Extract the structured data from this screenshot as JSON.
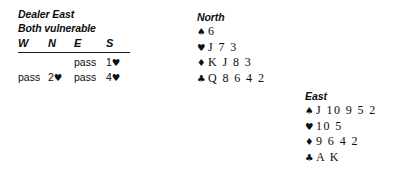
{
  "deal": {
    "dealer_line": "Dealer East",
    "vulnerability_line": "Both vulnerable"
  },
  "auction": {
    "headers": [
      "W",
      "N",
      "E",
      "S"
    ],
    "rows": [
      [
        {
          "text": "",
          "suit": ""
        },
        {
          "text": "",
          "suit": ""
        },
        {
          "text": "pass",
          "suit": ""
        },
        {
          "text": "1",
          "suit": "♥"
        }
      ],
      [
        {
          "text": "pass",
          "suit": ""
        },
        {
          "text": "2",
          "suit": "♥"
        },
        {
          "text": "pass",
          "suit": ""
        },
        {
          "text": "4",
          "suit": "♥"
        }
      ]
    ]
  },
  "hands": {
    "north": {
      "label": "North",
      "suits": [
        {
          "pip": "♠",
          "name": "spade-pip",
          "cards": "6"
        },
        {
          "pip": "♥",
          "name": "heart-pip",
          "cards": "J 7 3"
        },
        {
          "pip": "♦",
          "name": "diamond-pip",
          "cards": "K J 8 3"
        },
        {
          "pip": "♣",
          "name": "club-pip",
          "cards": "Q 8 6 4 2"
        }
      ]
    },
    "east": {
      "label": "East",
      "suits": [
        {
          "pip": "♠",
          "name": "spade-pip",
          "cards": "J 10 9 5 2"
        },
        {
          "pip": "♥",
          "name": "heart-pip",
          "cards": "10 5"
        },
        {
          "pip": "♦",
          "name": "diamond-pip",
          "cards": "9 6 4 2"
        },
        {
          "pip": "♣",
          "name": "club-pip",
          "cards": "A K"
        }
      ]
    }
  },
  "colors": {
    "text": "#0d0d0d",
    "rule": "#1a1a1a",
    "background": "#ffffff"
  }
}
